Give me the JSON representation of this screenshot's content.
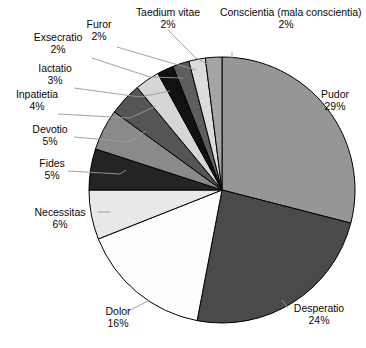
{
  "chart_data": {
    "type": "pie",
    "title": "",
    "subtitle": "",
    "xlabel": "",
    "ylabel": "",
    "legend_position": "none",
    "grid": false,
    "units": "percent",
    "start_angle_deg": 0,
    "direction": "clockwise",
    "categories": [
      "Pudor",
      "Desperatio",
      "Dolor",
      "Necessitas",
      "Fides",
      "Devotio",
      "Inpatietia",
      "Iactatio",
      "Exsecratio",
      "Furor",
      "Taedium vitae",
      "Conscientia (mala conscientia)"
    ],
    "values": [
      29,
      24,
      16,
      6,
      5,
      5,
      4,
      3,
      2,
      2,
      2,
      2
    ],
    "colors": [
      "#969696",
      "#4a4a4a",
      "#fdfdfd",
      "#e8e8e8",
      "#242424",
      "#8a8a8a",
      "#555555",
      "#d6d6d6",
      "#111111",
      "#5e5e5e",
      "#dcdcdc",
      "#a5a5a5"
    ],
    "slices": [
      {
        "label": "Pudor",
        "value": 29,
        "display": "29%",
        "color": "#969696"
      },
      {
        "label": "Desperatio",
        "value": 24,
        "display": "24%",
        "color": "#4a4a4a"
      },
      {
        "label": "Dolor",
        "value": 16,
        "display": "16%",
        "color": "#fdfdfd"
      },
      {
        "label": "Necessitas",
        "value": 6,
        "display": "6%",
        "color": "#e8e8e8"
      },
      {
        "label": "Fides",
        "value": 5,
        "display": "5%",
        "color": "#242424"
      },
      {
        "label": "Devotio",
        "value": 5,
        "display": "5%",
        "color": "#8a8a8a"
      },
      {
        "label": "Inpatietia",
        "value": 4,
        "display": "4%",
        "color": "#555555"
      },
      {
        "label": "Iactatio",
        "value": 3,
        "display": "3%",
        "color": "#d6d6d6"
      },
      {
        "label": "Exsecratio",
        "value": 2,
        "display": "2%",
        "color": "#111111"
      },
      {
        "label": "Furor",
        "value": 2,
        "display": "2%",
        "color": "#5e5e5e"
      },
      {
        "label": "Taedium vitae",
        "value": 2,
        "display": "2%",
        "color": "#dcdcdc"
      },
      {
        "label": "Conscientia (mala conscientia)",
        "value": 2,
        "display": "2%",
        "color": "#a5a5a5"
      }
    ]
  },
  "labels": {
    "pudor": {
      "name": "Pudor",
      "pct": "29%"
    },
    "desperatio": {
      "name": "Desperatio",
      "pct": "24%"
    },
    "dolor": {
      "name": "Dolor",
      "pct": "16%"
    },
    "necessitas": {
      "name": "Necessitas",
      "pct": "6%"
    },
    "fides": {
      "name": "Fides",
      "pct": "5%"
    },
    "devotio": {
      "name": "Devotio",
      "pct": "5%"
    },
    "inpatietia": {
      "name": "Inpatietia",
      "pct": "4%"
    },
    "iactatio": {
      "name": "Iactatio",
      "pct": "3%"
    },
    "exsecratio": {
      "name": "Exsecratio",
      "pct": "2%"
    },
    "furor": {
      "name": "Furor",
      "pct": "2%"
    },
    "taedium_vitae": {
      "name": "Taedium vitae",
      "pct": "2%"
    },
    "conscientia": {
      "name": "Conscientia (mala conscientia)",
      "pct": "2%"
    }
  }
}
